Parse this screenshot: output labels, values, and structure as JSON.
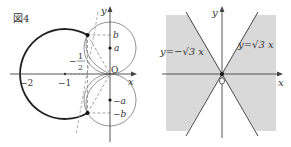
{
  "figure_label": "図4",
  "left": {
    "axis_x": "x",
    "axis_y": "y",
    "origin": "O",
    "ticks": [
      "−2",
      "−1"
    ],
    "half_num": "1",
    "half_den": "2",
    "half_sign": "−",
    "labels": {
      "b_top": "b",
      "a_top": "a",
      "a_bottom": "−a",
      "b_bottom": "−b"
    }
  },
  "right": {
    "axis_x": "x",
    "axis_y": "y",
    "line_left": "y=−√3 x",
    "line_right": "y=√3 x",
    "shade_color": "#d9d9d9"
  },
  "colors": {
    "ink": "#333333",
    "thin": "#666666",
    "dash": "#888888"
  }
}
